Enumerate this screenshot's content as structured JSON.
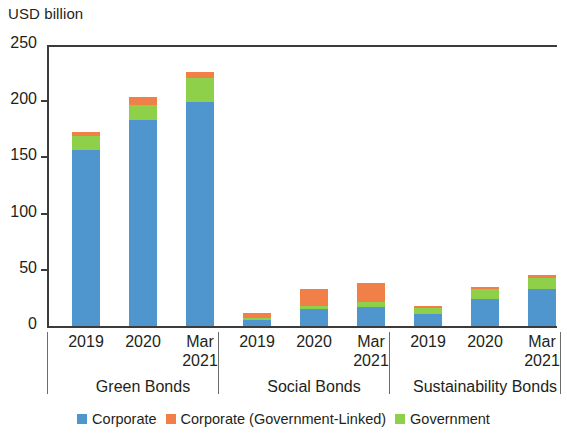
{
  "chart_data": {
    "type": "bar",
    "stacked": true,
    "title": "",
    "subtitle": "",
    "xlabel": "",
    "ylabel": "USD billion",
    "ylim": [
      0,
      250
    ],
    "yticks": [
      0,
      50,
      100,
      150,
      200,
      250
    ],
    "grid": false,
    "legend_position": "bottom",
    "groups": [
      {
        "name": "Green Bonds",
        "categories": [
          "2019",
          "2020",
          "Mar\n2021"
        ]
      },
      {
        "name": "Social Bonds",
        "categories": [
          "2019",
          "2020",
          "Mar\n2021"
        ]
      },
      {
        "name": "Sustainability Bonds",
        "categories": [
          "2019",
          "2020",
          "Mar\n2021"
        ]
      }
    ],
    "categories": [
      "Green Bonds 2019",
      "Green Bonds 2020",
      "Green Bonds Mar 2021",
      "Social Bonds 2019",
      "Social Bonds 2020",
      "Social Bonds Mar 2021",
      "Sustainability Bonds 2019",
      "Sustainability Bonds 2020",
      "Sustainability Bonds Mar 2021"
    ],
    "series": [
      {
        "name": "Corporate",
        "color": "#4e96cd",
        "values": [
          157,
          183,
          199,
          5,
          15,
          17,
          11,
          24,
          33
        ]
      },
      {
        "name": "Corporate (Government-Linked)",
        "color": "#f07f48",
        "values": [
          4,
          7,
          5,
          5,
          15,
          17,
          2,
          2,
          2
        ]
      },
      {
        "name": "Government",
        "color": "#8ed04a",
        "values": [
          12,
          14,
          22,
          2,
          3,
          4,
          5,
          9,
          10
        ]
      }
    ],
    "stack_order": [
      "Corporate",
      "Government",
      "Corporate (Government-Linked)"
    ],
    "totals": [
      173,
      204,
      226,
      12,
      33,
      38,
      18,
      35,
      45
    ]
  },
  "axis": {
    "ylabel": "USD billion",
    "ticks": [
      "250",
      "200",
      "150",
      "100",
      "50",
      "0"
    ]
  },
  "xaxis": {
    "labels": [
      "2019",
      "2020",
      "Mar\n2021",
      "2019",
      "2020",
      "Mar\n2021",
      "2019",
      "2020",
      "Mar\n2021"
    ],
    "groups": [
      "Green Bonds",
      "Social Bonds",
      "Sustainability Bonds"
    ]
  },
  "legend": {
    "items": [
      {
        "label": "Corporate",
        "color": "#4e96cd"
      },
      {
        "label": "Corporate (Government-Linked)",
        "color": "#f07f48"
      },
      {
        "label": "Government",
        "color": "#8ed04a"
      }
    ]
  }
}
